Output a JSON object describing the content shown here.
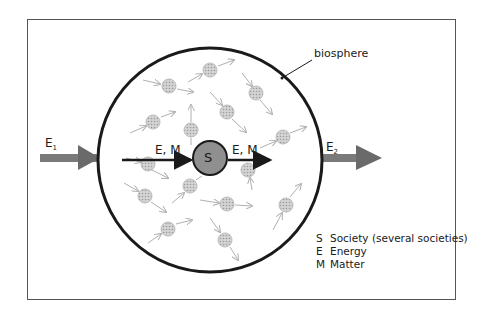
{
  "diagram": {
    "boundary_label": "biosphere",
    "center_label": "S",
    "inflow_label": "E, M",
    "outflow_label": "E, M",
    "external_input_label": "E",
    "external_input_sub": "1",
    "external_output_label": "E",
    "external_output_sub": "2"
  },
  "legend": {
    "items": [
      {
        "key": "S",
        "text": "Society (several societies)"
      },
      {
        "key": "E",
        "text": "Energy"
      },
      {
        "key": "M",
        "text": "Matter"
      }
    ]
  },
  "colors": {
    "outline": "#1a1a1a",
    "society_fill": "#8f8f8f",
    "particle": "#b5b5b5",
    "flow_arrow": "#6a6a6a"
  }
}
